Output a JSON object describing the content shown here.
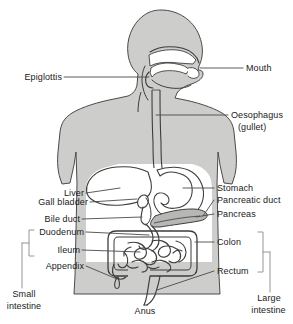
{
  "diagram": {
    "type": "anatomical-diagram",
    "colors": {
      "body_fill": "#cdcdcb",
      "organ_fill": "#ffffff",
      "organ_shade": "#b7b7b5",
      "outline": "#3d3d3d",
      "leader_line": "#4a4a4a",
      "text": "#1a1a1a",
      "background": "#ffffff"
    },
    "labels": {
      "epiglottis": "Epiglottis",
      "mouth": "Mouth",
      "oesophagus_line1": "Oesophagus",
      "oesophagus_line2": "(gullet)",
      "liver": "Liver",
      "gall_bladder": "Gall bladder",
      "bile_duct": "Bile duct",
      "duodenum": "Duodenum",
      "ileum": "Ileum",
      "appendix": "Appendix",
      "stomach": "Stomach",
      "pancreatic_duct": "Pancreatic duct",
      "pancreas": "Pancreas",
      "colon": "Colon",
      "rectum": "Rectum",
      "anus": "Anus",
      "small_intestine_line1": "Small",
      "small_intestine_line2": "intestine",
      "large_intestine_line1": "Large",
      "large_intestine_line2": "intestine"
    },
    "groupings": [
      {
        "name": "small-intestine",
        "members": [
          "Duodenum",
          "Ileum"
        ],
        "side": "left"
      },
      {
        "name": "large-intestine",
        "members": [
          "Colon",
          "Rectum"
        ],
        "side": "right"
      }
    ]
  }
}
